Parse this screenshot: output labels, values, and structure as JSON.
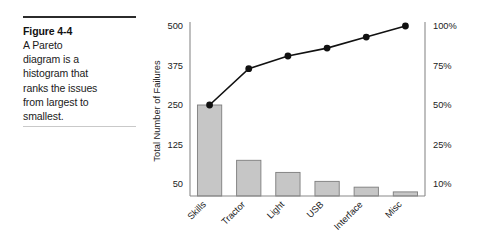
{
  "caption": {
    "figure_number": "Figure 4-4",
    "body_lines": [
      "A Pareto",
      "diagram is a",
      "histogram that",
      "ranks the issues",
      "from largest to",
      "smallest."
    ]
  },
  "chart_data": {
    "type": "bar",
    "title": "",
    "xlabel": "",
    "ylabel": "Total Number of Failures",
    "y2label": "",
    "categories": [
      "Skills",
      "Tractor",
      "Light",
      "USB",
      "Interface",
      "Misc"
    ],
    "values": [
      250,
      95,
      72,
      55,
      44,
      35
    ],
    "ytick_labels": [
      "50",
      "125",
      "250",
      "375",
      "500"
    ],
    "ytick_values": [
      50,
      125,
      250,
      375,
      500
    ],
    "y2tick_labels": [
      "10%",
      "25%",
      "50%",
      "75%",
      "100%"
    ],
    "y2tick_values": [
      10,
      25,
      50,
      75,
      100
    ],
    "series": [
      {
        "name": "Cumulative percentage",
        "type": "line",
        "values": [
          50,
          73,
          81,
          86,
          93,
          100
        ]
      }
    ],
    "grid": false,
    "legend": "none",
    "bar_color": "#c6c6c6",
    "bar_border_color": "#7d7d7d",
    "line_color": "#111111",
    "axis_color": "#8a8a8a"
  }
}
